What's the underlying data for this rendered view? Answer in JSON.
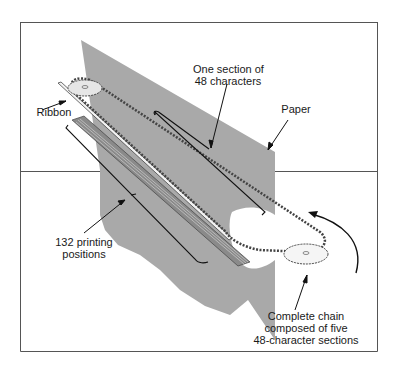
{
  "figure": {
    "labels": {
      "section": [
        "One section of",
        "48 characters"
      ],
      "paper": "Paper",
      "ribbon": "Ribbon",
      "positions": [
        "132 printing",
        "positions"
      ],
      "chain": [
        "Complete chain",
        "composed of five",
        "48-character sections"
      ]
    },
    "colors": {
      "paper": "#a9a9a9",
      "frame": "#555555",
      "line": "#1a1a1a"
    }
  }
}
